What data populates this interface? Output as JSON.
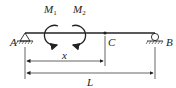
{
  "diagram": {
    "type": "simply-supported beam with two couple moments",
    "labels": {
      "support_left": "A",
      "support_right": "B",
      "point_c": "C",
      "moment1_main": "M",
      "moment1_sub": "1",
      "moment2_main": "M",
      "moment2_sub": "2",
      "dim_x": "x",
      "dim_L": "L"
    },
    "elements": {
      "beam": {
        "from": "A",
        "to": "B"
      },
      "support_A": "pin",
      "support_B": "roller",
      "moment1": {
        "direction": "counterclockwise"
      },
      "moment2": {
        "direction": "clockwise"
      },
      "dimension_x": {
        "from": "A",
        "to": "C"
      },
      "dimension_L": {
        "from": "A",
        "to": "B"
      }
    },
    "colors": {
      "ink": "#222222",
      "background": "#ffffff"
    }
  }
}
